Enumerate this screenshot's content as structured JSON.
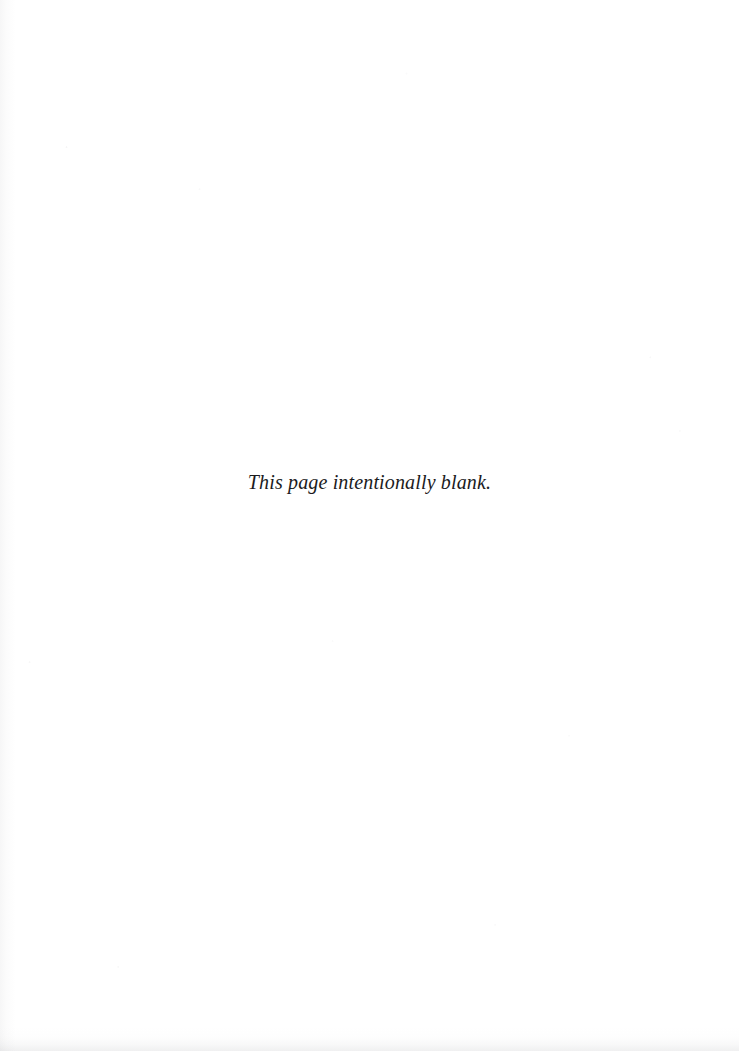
{
  "page": {
    "width": 739,
    "height": 1051,
    "background_color": "#fdfdfd",
    "text_color": "#1b1b1d"
  },
  "content": {
    "blank_notice": "This page intentionally blank."
  }
}
